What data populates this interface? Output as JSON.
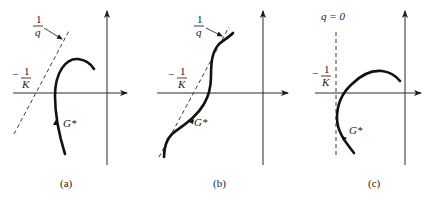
{
  "figure": {
    "panels": [
      {
        "id": "a",
        "caption": "(a)",
        "labels": {
          "q_numerator": "1",
          "q_denominator": "q",
          "k_minus": "−",
          "k_numerator": "1",
          "k_denominator": "K",
          "curve_label": "G*"
        },
        "line_type": "dashed sloped line (1/q)"
      },
      {
        "id": "b",
        "caption": "(b)",
        "labels": {
          "q_numerator": "1",
          "q_denominator": "q",
          "k_minus": "−",
          "k_numerator": "1",
          "k_denominator": "K",
          "curve_label": "G*"
        },
        "line_type": "dashed sloped line (1/q)"
      },
      {
        "id": "c",
        "caption": "(c)",
        "labels": {
          "q_zero": "q = 0",
          "k_minus": "−",
          "k_numerator": "1",
          "k_denominator": "K",
          "curve_label": "G*"
        },
        "line_type": "dashed vertical line (q = 0)"
      }
    ],
    "colors": {
      "ink": "#111111",
      "background": "#ffffff"
    }
  }
}
